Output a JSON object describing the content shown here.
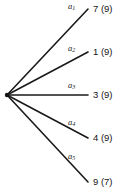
{
  "diagram": {
    "type": "fan-tree",
    "background_color": "#ffffff",
    "line_color": "#1a1a1a",
    "text_color": "#141414",
    "vertex": {
      "x": 7,
      "y": 95
    },
    "branches": [
      {
        "id": "a1",
        "edge_label": "a",
        "edge_subscript": "1",
        "value": "7 (9)",
        "label_x": 68,
        "label_y": 2,
        "value_x": 93,
        "value_y": 4,
        "end_x": 88,
        "end_y": 9
      },
      {
        "id": "a2",
        "edge_label": "a",
        "edge_subscript": "2",
        "value": "1 (9)",
        "label_x": 68,
        "label_y": 44,
        "value_x": 93,
        "value_y": 47,
        "end_x": 88,
        "end_y": 52
      },
      {
        "id": "a3",
        "edge_label": "a",
        "edge_subscript": "3",
        "value": "3 (9)",
        "label_x": 68,
        "label_y": 81,
        "value_x": 93,
        "value_y": 90,
        "end_x": 88,
        "end_y": 95
      },
      {
        "id": "a4",
        "edge_label": "a",
        "edge_subscript": "4",
        "value": "4 (9)",
        "label_x": 68,
        "label_y": 118,
        "value_x": 93,
        "value_y": 133,
        "end_x": 88,
        "end_y": 138
      },
      {
        "id": "a5",
        "edge_label": "a",
        "edge_subscript": "5",
        "value": "9 (7)",
        "label_x": 68,
        "label_y": 152,
        "value_x": 93,
        "value_y": 177,
        "end_x": 88,
        "end_y": 182
      }
    ]
  }
}
